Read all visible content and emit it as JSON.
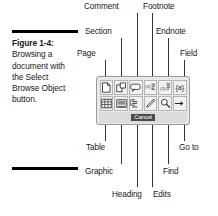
{
  "figure": {
    "number_label": "Figure 1-4:",
    "caption_text": "Browsing a document with the Select Browse Object button."
  },
  "callouts": {
    "top": [
      {
        "label": "Comment",
        "name": "callout-comment"
      },
      {
        "label": "Footnote",
        "name": "callout-footnote"
      },
      {
        "label": "Section",
        "name": "callout-section"
      },
      {
        "label": "Endnote",
        "name": "callout-endnote"
      },
      {
        "label": "Page",
        "name": "callout-page"
      },
      {
        "label": "Field",
        "name": "callout-field"
      }
    ],
    "bottom": [
      {
        "label": "Table",
        "name": "callout-table"
      },
      {
        "label": "Go to",
        "name": "callout-go-to"
      },
      {
        "label": "Graphic",
        "name": "callout-graphic"
      },
      {
        "label": "Find",
        "name": "callout-find"
      },
      {
        "label": "Heading",
        "name": "callout-heading"
      },
      {
        "label": "Edits",
        "name": "callout-edits"
      }
    ]
  },
  "palette": {
    "title": "Select Browse Object",
    "cancel_label": "Cancel",
    "row1": [
      {
        "icon": "page-icon",
        "tooltip": "Page"
      },
      {
        "icon": "section-icon",
        "tooltip": "Section"
      },
      {
        "icon": "comment-icon",
        "tooltip": "Comment"
      },
      {
        "icon": "footnote-icon",
        "tooltip": "Footnote"
      },
      {
        "icon": "endnote-icon",
        "tooltip": "Endnote"
      },
      {
        "icon": "field-icon",
        "tooltip": "Field",
        "glyph": "{a}"
      }
    ],
    "row2": [
      {
        "icon": "table-icon",
        "tooltip": "Table"
      },
      {
        "icon": "graphic-icon",
        "tooltip": "Graphic"
      },
      {
        "icon": "heading-icon",
        "tooltip": "Heading"
      },
      {
        "icon": "edits-icon",
        "tooltip": "Edits"
      },
      {
        "icon": "find-icon",
        "tooltip": "Find"
      },
      {
        "icon": "go-to-icon",
        "tooltip": "Go to"
      }
    ]
  },
  "colors": {
    "ink": "#1a1a1a",
    "rule": "#000000",
    "palette_bg": "#e9e9e9",
    "palette_border": "#9a9a9a",
    "cell_bg": "#f1f1f1",
    "cancel_highlight": "#4a4a4a"
  }
}
